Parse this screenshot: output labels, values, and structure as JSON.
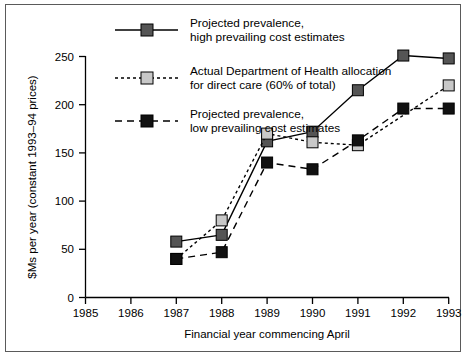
{
  "chart_data": {
    "type": "line",
    "title": "",
    "xlabel": "Financial year commencing April",
    "ylabel": "$Ms per year (constant 1993–94 prices)",
    "categories": [
      "1985",
      "1986",
      "1987",
      "1988",
      "1989",
      "1990",
      "1991",
      "1992",
      "1993"
    ],
    "x": [
      1985,
      1986,
      1987,
      1988,
      1989,
      1990,
      1991,
      1992,
      1993
    ],
    "xlim": [
      1985,
      1993
    ],
    "ylim": [
      0,
      250
    ],
    "yticks": [
      0,
      50,
      100,
      150,
      200,
      250
    ],
    "xticks": [
      "1985",
      "1986",
      "1987",
      "1988",
      "1989",
      "1990",
      "1991",
      "1992",
      "1993"
    ],
    "grid": false,
    "legend_position": "top-center",
    "series": [
      {
        "name": "Projected prevalence, high prevailing cost estimates",
        "legend_line1": "Projected prevalence,",
        "legend_line2": "high prevailing cost estimates",
        "line_style": "solid",
        "marker": "square",
        "marker_fill": "#555555",
        "line_color": "#000000",
        "x": [
          1987,
          1988,
          1989,
          1990,
          1991,
          1992,
          1993
        ],
        "values": [
          58,
          65,
          162,
          172,
          215,
          251,
          248
        ]
      },
      {
        "name": "Actual Department of Health allocation for direct care (60% of total)",
        "legend_line1": "Actual Department of Health allocation",
        "legend_line2": "for direct care (60% of total)",
        "line_style": "dotted",
        "marker": "square",
        "marker_fill": "#c8c8c8",
        "line_color": "#000000",
        "x": [
          1987,
          1988,
          1989,
          1990,
          1991,
          1993
        ],
        "values": [
          40,
          80,
          170,
          161,
          158,
          220
        ]
      },
      {
        "name": "Projected prevalence, low prevailing cost estimates",
        "legend_line1": "Projected prevalence,",
        "legend_line2": "low prevailing cost estimates",
        "line_style": "dashed",
        "marker": "square",
        "marker_fill": "#111111",
        "line_color": "#000000",
        "x": [
          1987,
          1988,
          1989,
          1990,
          1991,
          1992,
          1993
        ],
        "values": [
          40,
          47,
          140,
          133,
          163,
          196,
          196
        ]
      }
    ]
  },
  "axes": {
    "y_title": "$Ms per year (constant 1993–94 prices)",
    "x_title": "Financial year commencing April",
    "y_tick_labels": [
      "250",
      "200",
      "150",
      "100",
      "50",
      "0"
    ],
    "x_tick_labels": [
      "1985",
      "1986",
      "1987",
      "1988",
      "1989",
      "1990",
      "1991",
      "1992",
      "1993"
    ]
  },
  "legend": {
    "entries": [
      {
        "line1": "Projected prevalence,",
        "line2": "high prevailing cost estimates",
        "swatch": "solid-line-gray-square"
      },
      {
        "line1": "Actual Department of Health allocation",
        "line2": "for direct care (60% of total)",
        "swatch": "dotted-line-lightgray-square"
      },
      {
        "line1": "Projected prevalence,",
        "line2": "low prevailing cost estimates",
        "swatch": "dashed-line-black-square"
      }
    ]
  },
  "colors": {
    "frame": "#5a5a5a",
    "axis": "#000000",
    "high_marker": "#555555",
    "actual_marker": "#c8c8c8",
    "low_marker": "#111111"
  }
}
